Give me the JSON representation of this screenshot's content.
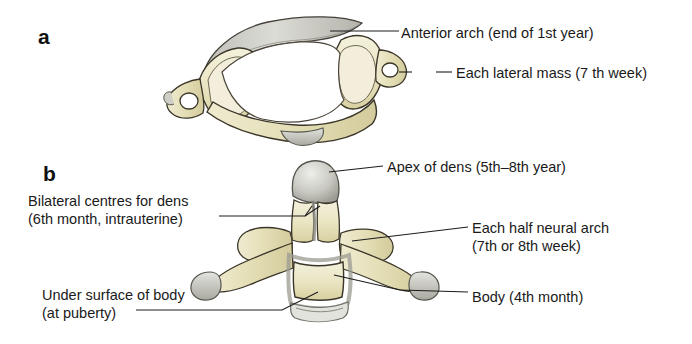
{
  "figure": {
    "background_color": "#ffffff"
  },
  "panels": [
    {
      "letter": "a",
      "subject": "atlas-superior-view",
      "labels": [
        {
          "id": "anterior-arch",
          "text": "Anterior arch (end of 1st year)"
        },
        {
          "id": "lateral-mass",
          "text": "Each lateral mass (7 th week)"
        }
      ]
    },
    {
      "letter": "b",
      "subject": "axis-anterior-view",
      "labels": [
        {
          "id": "apex-of-dens",
          "text": "Apex of dens (5th–8th year)"
        },
        {
          "id": "bilateral-centres-line1",
          "text": "Bilateral centres for dens"
        },
        {
          "id": "bilateral-centres-line2",
          "text": "(6th month, intrauterine)"
        },
        {
          "id": "half-neural-arch-line1",
          "text": "Each half neural arch"
        },
        {
          "id": "half-neural-arch-line2",
          "text": "(7th or 8th week)"
        },
        {
          "id": "body",
          "text": "Body (4th month)"
        },
        {
          "id": "under-surface-line1",
          "text": "Under surface of body"
        },
        {
          "id": "under-surface-line2",
          "text": "(at puberty)"
        }
      ]
    }
  ],
  "colors": {
    "bone": "#e9e4c2",
    "bone_light": "#f3f0da",
    "bone_shadow": "#ccc596",
    "cartilage": "#c3c3bb",
    "cartilage_light": "#dedede",
    "outline": "#3a3528",
    "leader": "#1c1c1c",
    "text": "#1a1a1a"
  }
}
